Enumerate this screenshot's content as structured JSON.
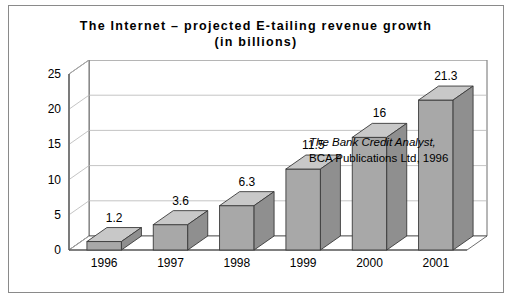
{
  "figure": {
    "title_line_1": "The Internet – projected E-tailing revenue growth",
    "title_line_2": "(in billions)",
    "title_full": "The Internet – projected E-tailing revenue growth\n(in billions)"
  },
  "annotation": {
    "line_1": "The Bank Credit Analyst,",
    "line_2": "BCA Publications Ltd, 1996"
  },
  "colors": {
    "bar_front": "#a8a8a8",
    "bar_top": "#c8c8c8",
    "bar_side": "#8f8f8f",
    "bar_outline": "#3a3a3a",
    "grid": "#b5b5b5",
    "axis": "#4a4a4a",
    "frame": "#8a8a8a",
    "text": "#000000",
    "background": "#ffffff"
  },
  "chart_data": {
    "type": "bar",
    "title": "The Internet – projected E-tailing revenue growth (in billions)",
    "subtitle": "(in billions)",
    "xlabel": "",
    "ylabel": "",
    "categories": [
      "1996",
      "1997",
      "1998",
      "1999",
      "2000",
      "2001"
    ],
    "values": [
      1.2,
      3.6,
      6.3,
      11.5,
      16,
      21.3
    ],
    "value_labels": [
      "1.2",
      "3.6",
      "6.3",
      "11.5",
      "16",
      "21.3"
    ],
    "ylim": [
      0,
      25
    ],
    "yticks": [
      0,
      5,
      10,
      15,
      20,
      25
    ],
    "ytick_labels": [
      "0",
      "5",
      "10",
      "15",
      "20",
      "25"
    ],
    "grid": true,
    "grid_axis": "y",
    "legend": false,
    "legend_position": "none",
    "three_d": true,
    "units": "billions of dollars",
    "annotations": [
      "The Bank Credit Analyst,",
      "BCA Publications Ltd, 1996"
    ]
  }
}
